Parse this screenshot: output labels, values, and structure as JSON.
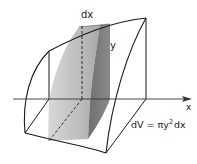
{
  "figure": {
    "labels": {
      "slice_thickness": "dx",
      "radius": "y",
      "axis": "x",
      "formula_lhs": "dV = πy",
      "formula_exp": "2",
      "formula_rhs": "dx"
    },
    "colors": {
      "outline": "#1a1a1a",
      "slice_light": "#c8c8c8",
      "slice_mid": "#a9a9a9",
      "slice_dark": "#7d7d7d",
      "axis": "#333333"
    }
  }
}
